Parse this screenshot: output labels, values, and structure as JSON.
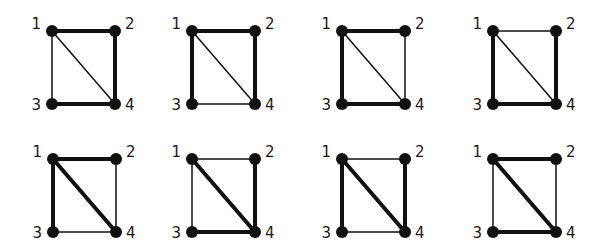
{
  "diagram": {
    "type": "graph-grid",
    "node_color": "#111111",
    "edge_color": "#111111",
    "node_labels": [
      "1",
      "2",
      "3",
      "4"
    ],
    "layout": {
      "rows": 2,
      "cols": 4
    },
    "graphs": [
      {
        "id": "g1",
        "origin": [
          52,
          31
        ],
        "thick": [
          "1-2",
          "2-4",
          "3-4"
        ],
        "thin": [
          "1-3",
          "1-4"
        ]
      },
      {
        "id": "g2",
        "origin": [
          192,
          31
        ],
        "thick": [
          "1-2",
          "1-3",
          "2-4"
        ],
        "thin": [
          "3-4",
          "1-4"
        ]
      },
      {
        "id": "g3",
        "origin": [
          342,
          31
        ],
        "thick": [
          "1-2",
          "1-3",
          "3-4"
        ],
        "thin": [
          "2-4",
          "1-4"
        ]
      },
      {
        "id": "g4",
        "origin": [
          493,
          31
        ],
        "thick": [
          "1-3",
          "2-4",
          "3-4"
        ],
        "thin": [
          "1-2",
          "1-4"
        ]
      },
      {
        "id": "g5",
        "origin": [
          53,
          159
        ],
        "thick": [
          "1-2",
          "1-3",
          "1-4"
        ],
        "thin": [
          "2-4",
          "3-4"
        ]
      },
      {
        "id": "g6",
        "origin": [
          192,
          159
        ],
        "thick": [
          "1-4",
          "2-4",
          "3-4"
        ],
        "thin": [
          "1-2",
          "1-3"
        ]
      },
      {
        "id": "g7",
        "origin": [
          342,
          159
        ],
        "thick": [
          "1-3",
          "1-4",
          "2-4"
        ],
        "thin": [
          "1-2",
          "3-4"
        ]
      },
      {
        "id": "g8",
        "origin": [
          493,
          159
        ],
        "thick": [
          "1-2",
          "1-4",
          "3-4"
        ],
        "thin": [
          "1-3",
          "2-4"
        ]
      }
    ],
    "geometry": {
      "width": 63,
      "height": 63,
      "node_radius": 6,
      "thick_width": 4,
      "thin_width": 1.5
    }
  }
}
